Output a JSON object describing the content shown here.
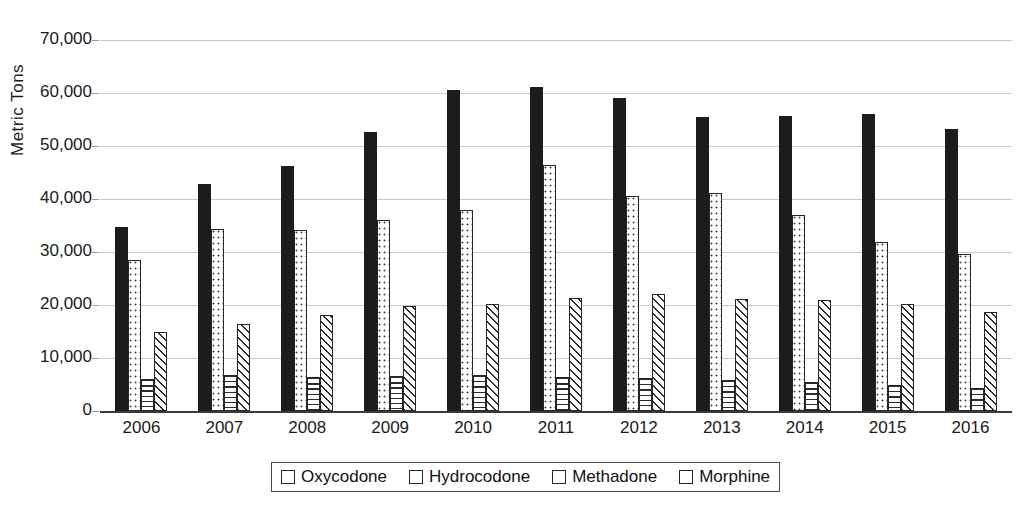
{
  "chart_data": {
    "type": "bar",
    "title": "",
    "xlabel": "",
    "ylabel": "Metric Tons",
    "ylim": [
      0,
      70000
    ],
    "ytick_values": [
      0,
      10000,
      20000,
      30000,
      40000,
      50000,
      60000,
      70000
    ],
    "ytick_labels": [
      "0",
      "10,000",
      "20,000",
      "30,000",
      "40,000",
      "50,000",
      "60,000",
      "70,000"
    ],
    "grid": true,
    "legend_position": "bottom",
    "categories": [
      "2006",
      "2007",
      "2008",
      "2009",
      "2010",
      "2011",
      "2012",
      "2013",
      "2014",
      "2015",
      "2016"
    ],
    "series": [
      {
        "name": "Oxycodone",
        "pattern": "solid-black",
        "values": [
          34700,
          42800,
          46200,
          52600,
          60500,
          61200,
          59100,
          55400,
          55600,
          56000,
          53300
        ]
      },
      {
        "name": "Hydrocodone",
        "pattern": "dotted",
        "values": [
          28400,
          34300,
          34100,
          36000,
          38000,
          46400,
          40500,
          41200,
          37000,
          31900,
          29700
        ]
      },
      {
        "name": "Methadone",
        "pattern": "horizontal-lines",
        "values": [
          6100,
          6800,
          6400,
          6600,
          6800,
          6500,
          6200,
          5800,
          5400,
          5000,
          4400
        ]
      },
      {
        "name": "Morphine",
        "pattern": "diagonal-hatch",
        "values": [
          14900,
          16400,
          18200,
          19900,
          20100,
          21400,
          22100,
          21200,
          20900,
          20100,
          18700
        ]
      }
    ]
  },
  "legend": {
    "items": [
      {
        "label": "Oxycodone"
      },
      {
        "label": "Hydrocodone"
      },
      {
        "label": "Methadone"
      },
      {
        "label": "Morphine"
      }
    ]
  },
  "colors": {
    "oxycodone": "#1c1c1c",
    "gridline": "#c9c9c9",
    "axis": "#3a3a3a",
    "text": "#1a1a1a",
    "background": "#ffffff"
  }
}
